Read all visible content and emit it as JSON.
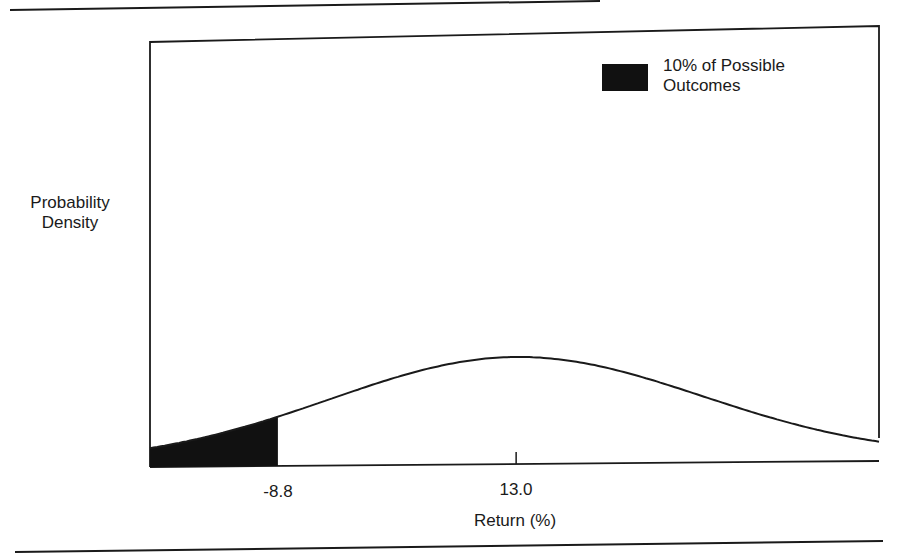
{
  "chart_data": {
    "type": "area",
    "title": "",
    "xlabel": "Return (%)",
    "ylabel": "Probability Density",
    "distribution": "normal",
    "mean": 13.0,
    "std_dev_estimate": 17.0,
    "x_range": [
      -20.5,
      46.2
    ],
    "x_ticks": [
      {
        "value": -8.8,
        "label": "-8.8"
      },
      {
        "value": 13.0,
        "label": "13.0"
      }
    ],
    "shaded_region": {
      "from": -20.5,
      "to": -8.8,
      "color": "#111111",
      "label": "10% of Possible Outcomes"
    },
    "legend": {
      "position": "top-right",
      "entries": [
        {
          "label": "10% of Possible Outcomes",
          "color": "#111111"
        }
      ]
    },
    "grid": false
  },
  "labels": {
    "ylabel_line1": "Probability",
    "ylabel_line2": "Density",
    "legend_line1": "10% of Possible",
    "legend_line2": "Outcomes",
    "tick_left": "-8.8",
    "tick_center": "13.0",
    "xlabel": "Return (%)"
  },
  "colors": {
    "ink": "#1a1a1a",
    "fill": "#111111",
    "background": "#ffffff"
  }
}
